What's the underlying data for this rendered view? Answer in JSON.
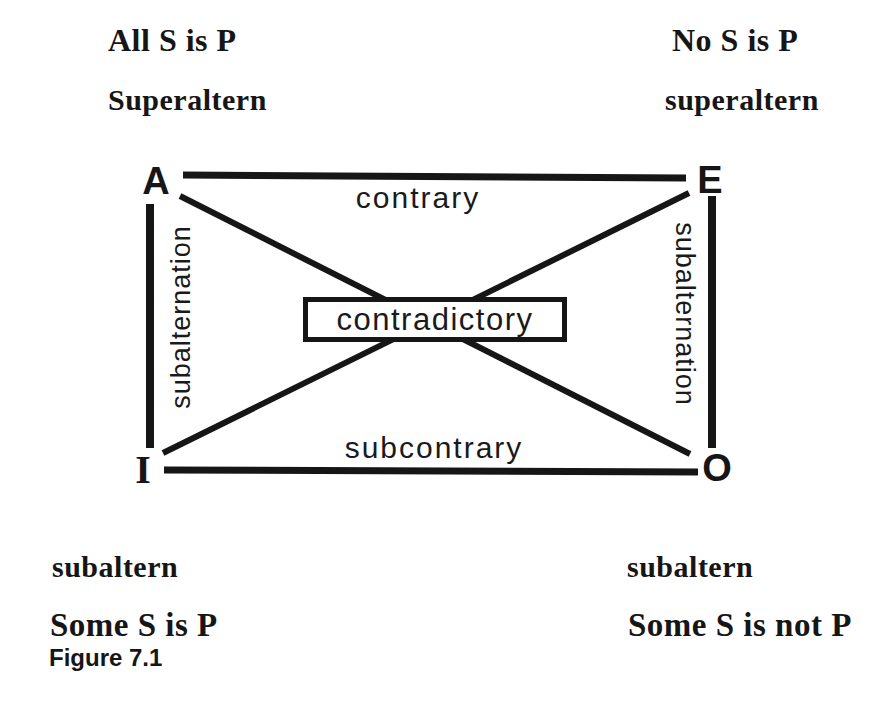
{
  "figure_caption": "Figure 7.1",
  "square": {
    "corners": {
      "A": {
        "letter": "A",
        "statement": "All S is P",
        "relation_label": "Superaltern"
      },
      "E": {
        "letter": "E",
        "statement": "No S is P",
        "relation_label": "superaltern"
      },
      "I": {
        "letter": "I",
        "statement": "Some S is P",
        "relation_label": "subaltern"
      },
      "O": {
        "letter": "O",
        "statement": "Some S is not P",
        "relation_label": "subaltern"
      }
    },
    "relations": {
      "top": "contrary",
      "bottom": "subcontrary",
      "left": "subalternation",
      "right": "subalternation",
      "diagonals": "contradictory"
    }
  },
  "colors": {
    "ink": "#161616",
    "background": "#ffffff"
  }
}
